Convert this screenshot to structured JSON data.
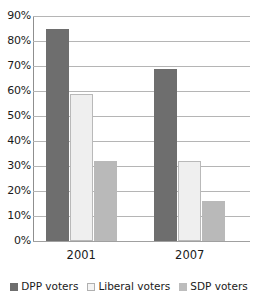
{
  "chart_data": {
    "type": "bar",
    "title": "",
    "subtitle": "",
    "xlabel": "",
    "ylabel": "",
    "categories": [
      "2001",
      "2007"
    ],
    "series": [
      {
        "name": "DPP voters",
        "values": [
          85,
          69
        ],
        "color": "#6e6e6e"
      },
      {
        "name": "Liberal voters",
        "values": [
          59,
          32
        ],
        "color": "#efefef"
      },
      {
        "name": "SDP voters",
        "values": [
          32,
          16
        ],
        "color": "#b9b9b9"
      }
    ],
    "ylim": [
      0,
      90
    ],
    "ytick_step": 10,
    "ytick_labels": [
      "90%",
      "80%",
      "70%",
      "60%",
      "50%",
      "40%",
      "30%",
      "20%",
      "10%",
      "0%"
    ],
    "ytick_values": [
      90,
      80,
      70,
      60,
      50,
      40,
      30,
      20,
      10,
      0
    ],
    "grid": true,
    "legend_position": "bottom",
    "value_suffix": "%"
  },
  "legend": {
    "entries": [
      {
        "label": "DPP voters",
        "swatch": "dpp-swatch"
      },
      {
        "label": "Liberal voters",
        "swatch": "liberal-swatch"
      },
      {
        "label": "SDP voters",
        "swatch": "sdp-swatch"
      }
    ]
  }
}
